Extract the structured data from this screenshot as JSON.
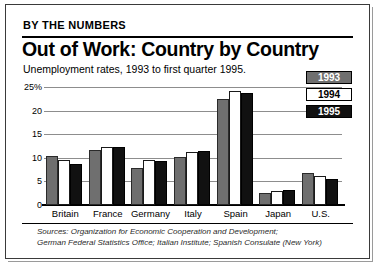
{
  "header": {
    "kicker": "BY THE NUMBERS",
    "headline": "Out of Work: Country by Country",
    "subhead": "Unemployment rates, 1993 to first quarter 1995."
  },
  "legend": {
    "items": [
      {
        "label": "1993",
        "color": "#6f6f6f"
      },
      {
        "label": "1994",
        "color": "#ffffff"
      },
      {
        "label": "1995",
        "color": "#111111"
      }
    ]
  },
  "sources": {
    "line1": "Sources: Organization for Economic Cooperation and Development;",
    "line2": "German Federal Statistics Office; Italian Institute; Spanish Consulate (New York)"
  },
  "chart_data": {
    "type": "bar",
    "title": "Out of Work: Country by Country",
    "subtitle": "Unemployment rates, 1993 to first quarter 1995.",
    "xlabel": "",
    "ylabel": "",
    "ylim": [
      0,
      25
    ],
    "yticks": [
      "25%",
      "20",
      "15",
      "10",
      "5",
      "0"
    ],
    "ytick_values": [
      25,
      20,
      15,
      10,
      5,
      0
    ],
    "grid": true,
    "legend_position": "right",
    "categories": [
      "Britain",
      "France",
      "Germany",
      "Italy",
      "Spain",
      "Japan",
      "U.S."
    ],
    "series": [
      {
        "name": "1993",
        "color": "#6f6f6f",
        "values": [
          10.3,
          11.7,
          7.9,
          10.2,
          22.4,
          2.5,
          6.8
        ]
      },
      {
        "name": "1994",
        "color": "#ffffff",
        "values": [
          9.6,
          12.3,
          9.6,
          11.3,
          24.2,
          2.9,
          6.1
        ]
      },
      {
        "name": "1995",
        "color": "#111111",
        "values": [
          8.6,
          12.2,
          9.3,
          11.5,
          23.8,
          3.1,
          5.5
        ]
      }
    ]
  }
}
